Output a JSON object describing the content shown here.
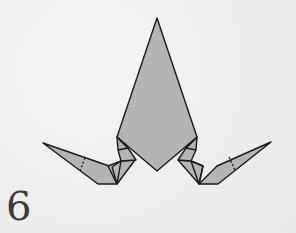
{
  "diagram": {
    "type": "origami-fold-step",
    "step_number": "6",
    "colors": {
      "background": "#f1f1f1",
      "paper_fill": "#b4b4b4",
      "outline": "#1a1a1a",
      "step_number": "#3a3a3a"
    }
  }
}
